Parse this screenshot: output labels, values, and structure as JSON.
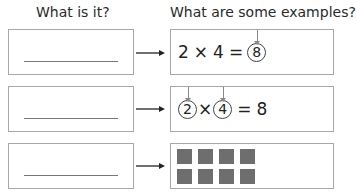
{
  "headers": {
    "left": "What is it?",
    "right": "What are some examples?"
  },
  "rows": [
    {
      "example_type": "equation",
      "parts": [
        "2",
        "×",
        "4",
        "=",
        "8"
      ],
      "circled_indices": [
        4
      ],
      "pointed_label": "product"
    },
    {
      "example_type": "equation",
      "parts": [
        "2",
        "×",
        "4",
        "=",
        "8"
      ],
      "circled_indices": [
        0,
        2
      ],
      "pointed_label": "factors"
    },
    {
      "example_type": "array",
      "array_rows": 2,
      "array_cols": 4
    }
  ],
  "row0": {
    "a": "2",
    "op": "×",
    "b": "4",
    "eq": "=",
    "c": "8"
  },
  "row1": {
    "a": "2",
    "op": "×",
    "b": "4",
    "eq": "=",
    "c": "8"
  },
  "colors": {
    "box_border": "#a8a8a8",
    "square_fill": "#6e6e6e",
    "text": "#222222"
  }
}
